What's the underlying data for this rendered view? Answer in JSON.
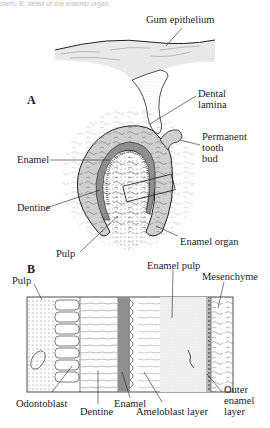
{
  "caption_fragment": "stem, B, detail of the enamel organ",
  "panel_a": {
    "letter": "A",
    "labels": {
      "gum_epithelium": "Gum epithelium",
      "dental_lamina_1": "Dental",
      "dental_lamina_2": "lamina",
      "permanent_1": "Permanent",
      "permanent_2": "tooth",
      "permanent_3": "bud",
      "enamel": "Enamel",
      "dentine": "Dentine",
      "pulp": "Pulp",
      "enamel_organ": "Enamel organ"
    }
  },
  "panel_b": {
    "letter": "B",
    "labels": {
      "pulp": "Pulp",
      "enamel_pulp": "Enamel pulp",
      "mesenchyme": "Mesenchyme",
      "odontoblast": "Odontoblast",
      "dentine": "Dentine",
      "enamel": "Enamel",
      "ameloblast_layer": "Ameloblast layer",
      "outer_1": "Outer",
      "outer_2": "enamel",
      "outer_3": "layer"
    }
  },
  "colors": {
    "gum": "#e6e6e6",
    "enamel": "#8f8f8f",
    "enamel_organ": "#cfcfcf",
    "line": "#222222"
  }
}
